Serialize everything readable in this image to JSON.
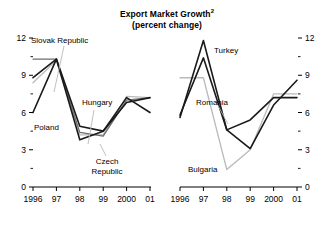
{
  "title": {
    "line1": "Export Market Growth",
    "superscript": "2",
    "line2": "(percent change)"
  },
  "axis": {
    "y_ticks": [
      "12",
      "9",
      "6",
      "3",
      "0"
    ],
    "y_values": [
      12,
      9,
      6,
      3,
      0
    ],
    "x_ticks": [
      "1996",
      "97",
      "98",
      "99",
      "2000",
      "01"
    ]
  },
  "annotations": {
    "slovak_republic": "Slovak Republic",
    "hungary": "Hungary",
    "poland": "Poland",
    "czech_republic_l1": "Czech",
    "czech_republic_l2": "Republic",
    "turkey": "Turkey",
    "romania": "Romania",
    "bulgaria": "Bulgaria"
  },
  "colors": {
    "line_dark": "#1a1a1a",
    "line_mid": "#6e6e6e",
    "line_light": "#b9b9b9",
    "axis": "#000000",
    "background": "#ffffff"
  },
  "chart_data": {
    "type": "line",
    "xlabel": "",
    "ylabel": "",
    "ylim": [
      0,
      12
    ],
    "grid": false,
    "legend": "inline-annotations",
    "panels": [
      {
        "name": "left",
        "x": [
          "1996",
          "97",
          "98",
          "99",
          "2000",
          "01"
        ],
        "series": [
          {
            "name": "Slovak Republic",
            "color": "#6e6e6e",
            "values": [
              10.3,
              10.3,
              4.4,
              4.1,
              7.0,
              7.2
            ]
          },
          {
            "name": "Hungary",
            "color": "#1a1a1a",
            "values": [
              8.8,
              10.3,
              4.9,
              4.5,
              7.2,
              6.0
            ]
          },
          {
            "name": "Poland",
            "color": "#1a1a1a",
            "values": [
              6.0,
              10.3,
              3.8,
              4.5,
              6.8,
              7.2
            ]
          },
          {
            "name": "Czech Republic",
            "color": "#b9b9b9",
            "values": [
              8.4,
              10.2,
              4.2,
              4.2,
              7.3,
              7.2
            ]
          }
        ]
      },
      {
        "name": "right",
        "x": [
          "1996",
          "97",
          "98",
          "99",
          "2000",
          "01"
        ],
        "series": [
          {
            "name": "Turkey",
            "color": "#1a1a1a",
            "values": [
              5.6,
              11.8,
              4.6,
              5.4,
              7.2,
              7.2
            ]
          },
          {
            "name": "Romania",
            "color": "#1a1a1a",
            "values": [
              5.8,
              10.4,
              4.6,
              3.1,
              6.6,
              8.6
            ]
          },
          {
            "name": "Bulgaria",
            "color": "#b9b9b9",
            "values": [
              8.8,
              8.8,
              1.4,
              3.0,
              7.5,
              7.5
            ]
          }
        ]
      }
    ]
  }
}
